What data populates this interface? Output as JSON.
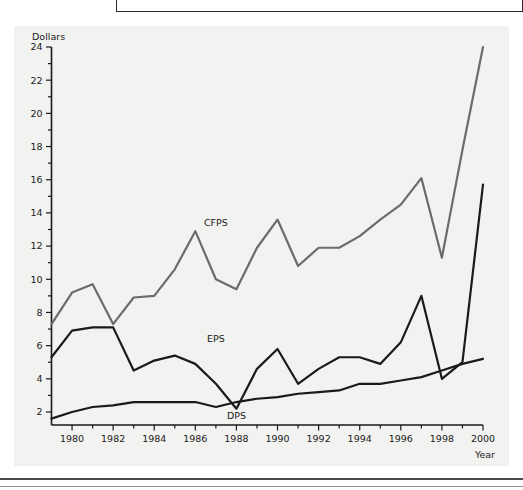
{
  "chart_data": {
    "type": "line",
    "title": "",
    "xlabel": "Year",
    "ylabel": "Dollars",
    "xlim": [
      1979,
      2000
    ],
    "ylim": [
      0,
      24
    ],
    "yticks": [
      2,
      4,
      6,
      8,
      10,
      12,
      14,
      16,
      18,
      20,
      22,
      24
    ],
    "ytick_labels": [
      "2",
      "4",
      "6",
      "8",
      "10",
      "12",
      "14",
      "16",
      "18",
      "20",
      "22",
      "24"
    ],
    "xticks": [
      1980,
      1982,
      1984,
      1986,
      1988,
      1990,
      1992,
      1994,
      1996,
      1998,
      2000
    ],
    "xtick_labels": [
      "1980",
      "1982",
      "1984",
      "1986",
      "1988",
      "1990",
      "1992",
      "1994",
      "1996",
      "1998",
      "2000"
    ],
    "grid": false,
    "legend_position": "inline-annotation",
    "x": [
      1979,
      1980,
      1981,
      1982,
      1983,
      1984,
      1985,
      1986,
      1987,
      1988,
      1989,
      1990,
      1991,
      1992,
      1993,
      1994,
      1995,
      1996,
      1997,
      1998,
      1999,
      2000
    ],
    "series": [
      {
        "name": "CFPS",
        "color": "#6b6b6b",
        "label_x": 1987,
        "label_y": 13.2,
        "values": [
          7.3,
          9.2,
          9.7,
          7.3,
          8.9,
          9.0,
          10.6,
          12.9,
          10.0,
          9.4,
          11.9,
          13.6,
          10.8,
          11.9,
          11.9,
          12.6,
          13.6,
          14.5,
          16.1,
          11.3,
          17.8,
          24.0
        ]
      },
      {
        "name": "EPS",
        "color": "#1a1a1a",
        "label_x": 1987,
        "label_y": 6.2,
        "values": [
          5.3,
          6.9,
          7.1,
          7.1,
          4.5,
          5.1,
          5.4,
          4.9,
          3.7,
          2.2,
          4.6,
          5.8,
          3.7,
          4.6,
          5.3,
          5.3,
          4.9,
          6.2,
          9.0,
          4.0,
          5.0,
          15.7
        ]
      },
      {
        "name": "DPS",
        "color": "#1a1a1a",
        "label_x": 1988,
        "label_y": 1.6,
        "values": [
          1.6,
          2.0,
          2.3,
          2.4,
          2.6,
          2.6,
          2.6,
          2.6,
          2.3,
          2.6,
          2.8,
          2.9,
          3.1,
          3.2,
          3.3,
          3.7,
          3.7,
          3.9,
          4.1,
          4.5,
          4.9,
          5.2
        ]
      }
    ]
  },
  "axis": {
    "y_title": "Dollars",
    "x_title": "Year"
  }
}
